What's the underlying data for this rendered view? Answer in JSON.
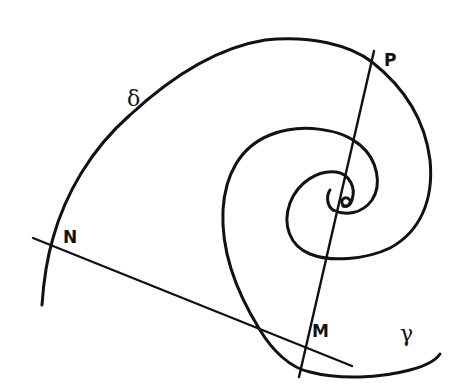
{
  "figure": {
    "type": "hand-drawn geometric diagram",
    "background": "#ffffff",
    "ink_color": "#111111"
  },
  "labels": {
    "delta": "δ",
    "P": "P",
    "N": "N",
    "M": "M",
    "gamma": "γ",
    "O": "o"
  },
  "elements": {
    "curve_delta": "outer curve δ from lower-left through N, over the top, through P, spiralling inward to the pole",
    "curve_gamma": "curve γ from the pole spiralling outward, passing through M and extending right",
    "line_NM": "straight line through N and M, tangent to γ at M",
    "line_PM": "straight line through P, the pole O, and M"
  }
}
